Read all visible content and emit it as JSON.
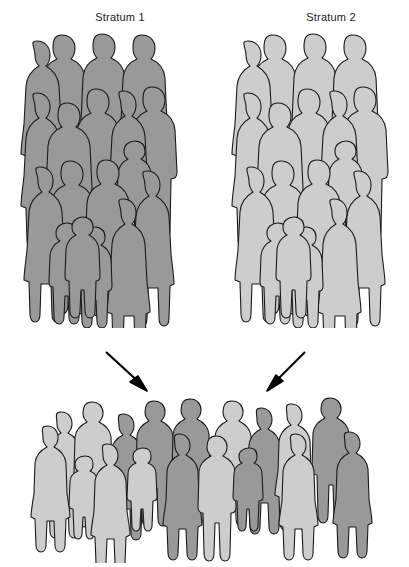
{
  "figure": {
    "type": "diagram",
    "topic": "stratified-sampling",
    "background_color": "#ffffff",
    "outline_color": "#1a1a1a",
    "width": 409,
    "height": 567
  },
  "labels": {
    "stratum_1": "Stratum 1",
    "stratum_2": "Stratum 2"
  },
  "colors": {
    "dark_gray": "#999999",
    "light_gray": "#cdcdcd",
    "outline": "#1a1a1a",
    "arrow": "#000000"
  },
  "groups": [
    {
      "name": "stratum-1",
      "label": "Stratum 1",
      "fill": "#999999",
      "people_count": 18,
      "position": "top-left"
    },
    {
      "name": "stratum-2",
      "label": "Stratum 2",
      "fill": "#cdcdcd",
      "people_count": 18,
      "position": "top-right"
    },
    {
      "name": "combined-sample",
      "label": "",
      "fill": "mixed",
      "people_count": 18,
      "position": "bottom-center"
    }
  ],
  "arrows": [
    {
      "name": "arrow-from-stratum-1",
      "direction": "down-right"
    },
    {
      "name": "arrow-from-stratum-2",
      "direction": "down-left"
    }
  ],
  "sample_shades": [
    "light",
    "light",
    "dark",
    "dark",
    "dark",
    "light",
    "dark",
    "light",
    "dark",
    "light",
    "dark",
    "light",
    "dark",
    "light",
    "light",
    "dark",
    "light",
    "dark"
  ]
}
